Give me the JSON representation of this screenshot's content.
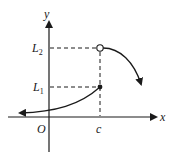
{
  "diagram": {
    "axes": {
      "x_label": "x",
      "y_label": "y",
      "origin_label": "O"
    },
    "ticks": {
      "x_tick_label": "c",
      "y_tick_labels": {
        "lower": "L",
        "lower_sub": "1",
        "upper": "L",
        "upper_sub": "2"
      }
    },
    "points": [
      {
        "name": "left-limit-point",
        "label": "(c, L1)",
        "style": "filled"
      },
      {
        "name": "right-limit-point",
        "label": "(c, L2)",
        "style": "open"
      }
    ],
    "colors": {
      "stroke": "#1a1a1a",
      "background": "#ffffff"
    }
  }
}
